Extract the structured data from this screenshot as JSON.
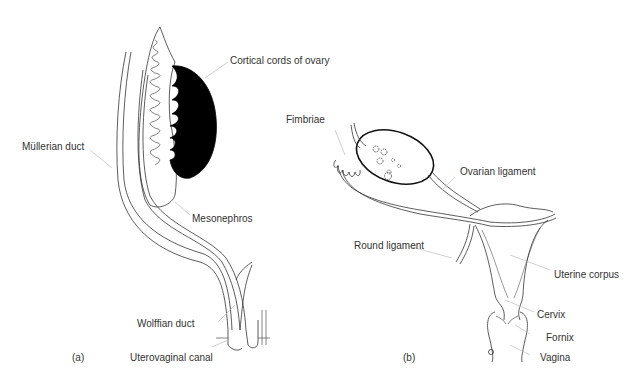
{
  "panels": {
    "a": {
      "tag": "(a)",
      "labels": {
        "cortical_cords": "Cortical cords of ovary",
        "mullerian_duct": "Müllerian duct",
        "mesonephros": "Mesonephros",
        "wolffian_duct": "Wolffian duct",
        "uterovaginal_canal": "Uterovaginal canal"
      }
    },
    "b": {
      "tag": "(b)",
      "labels": {
        "fimbriae": "Fimbriae",
        "ovarian_ligament": "Ovarian ligament",
        "round_ligament": "Round ligament",
        "uterine_corpus": "Uterine corpus",
        "cervix": "Cervix",
        "fornix": "Fornix",
        "vagina": "Vagina"
      }
    }
  },
  "colors": {
    "line": "#333333",
    "leader": "#bbbbbb",
    "fill": "#000000"
  }
}
